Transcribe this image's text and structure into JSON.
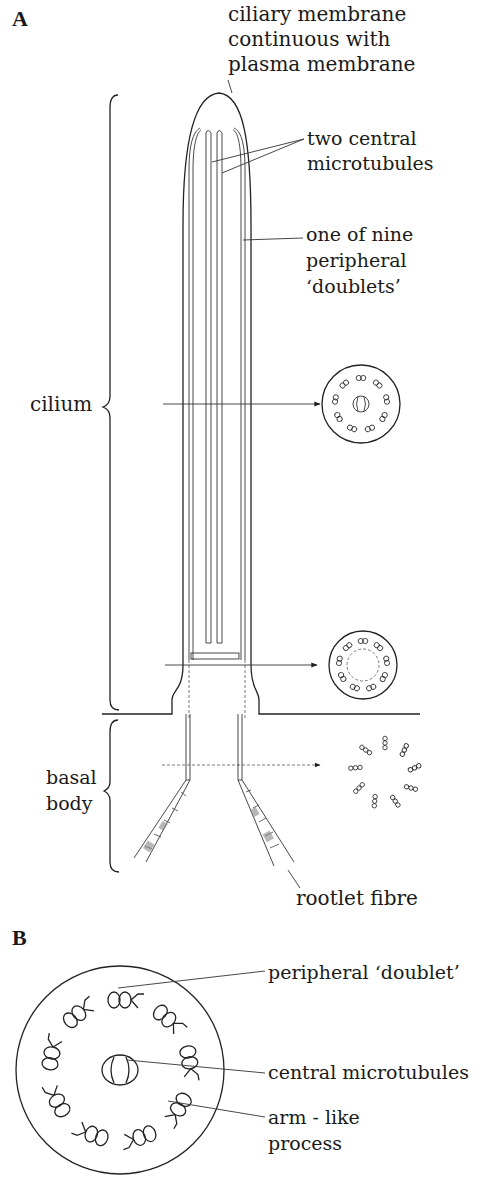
{
  "figure": {
    "panel_a": {
      "label": "A",
      "annotations": {
        "ciliary_membrane": [
          "ciliary membrane",
          "continuous with",
          "plasma membrane"
        ],
        "central_microtubules": [
          "two central",
          "microtubules"
        ],
        "peripheral_doublets": [
          "one of nine",
          "peripheral",
          "‘doublets’"
        ],
        "cilium": "cilium",
        "basal_body": [
          "basal",
          "body"
        ],
        "rootlet_fibre": "rootlet fibre"
      },
      "cross_sections": [
        {
          "position": "cilium shaft",
          "pattern": "9 doublets + 2 central"
        },
        {
          "position": "transition zone",
          "pattern": "9 doublets, no central"
        },
        {
          "position": "basal body",
          "pattern": "9 triplets"
        }
      ]
    },
    "panel_b": {
      "label": "B",
      "annotations": {
        "peripheral_doublet": "peripheral ‘doublet’",
        "central_microtubules": "central microtubules",
        "arm_like_process": [
          "arm - like",
          "process"
        ]
      }
    }
  }
}
